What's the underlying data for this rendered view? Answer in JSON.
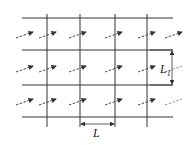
{
  "diagram": {
    "type": "grid-layout",
    "line_color": "#333333",
    "arrow_color": "#333333",
    "horizontal_lines_y": [
      18,
      50,
      85,
      117
    ],
    "vertical_lines_x": [
      47,
      80,
      115,
      147
    ],
    "arrow_rows_y": [
      34,
      68,
      101
    ],
    "arrow_cols_x": [
      16,
      39,
      69,
      105,
      138,
      165
    ],
    "labels": {
      "horizontal_spacing": "L",
      "vertical_spacing": "L",
      "vertical_spacing_subscript": "1"
    }
  }
}
